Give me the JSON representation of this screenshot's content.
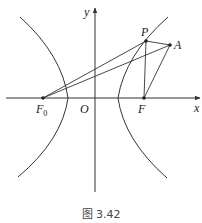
{
  "figure": {
    "caption": "图 3.42",
    "colors": {
      "stroke": "#333333",
      "background": "#ffffff"
    }
  },
  "axes": {
    "x_label": "x",
    "y_label": "y",
    "origin_label": "O"
  },
  "points": {
    "F0": {
      "label": "F",
      "subscript": "0",
      "x": 43,
      "y": 98
    },
    "F": {
      "label": "F",
      "x": 144,
      "y": 98
    },
    "P": {
      "label": "P",
      "x": 146,
      "y": 41
    },
    "A": {
      "label": "A",
      "x": 170,
      "y": 45
    }
  },
  "segments": [
    "F0-P",
    "F0-A",
    "P-A",
    "P-F",
    "A-F"
  ],
  "curves": [
    "hyperbola-left-branch",
    "hyperbola-right-branch"
  ]
}
